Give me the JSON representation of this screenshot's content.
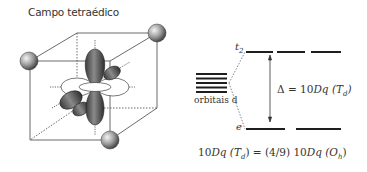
{
  "title": "Campo tetraédico",
  "left_figure": {
    "description": "Cube with ligands at alternating corners and d-orbital lobes at center",
    "ligand_count": 4
  },
  "energy_diagram": {
    "upper_level_label": "t",
    "upper_level_sub": "2",
    "lower_level_label": "e",
    "degenerate_label": "orbitais d",
    "splitting_label": "Δ = 10",
    "splitting_var": "Dq",
    "splitting_paren_open": " (T",
    "splitting_sub": "d",
    "splitting_paren_close": ")",
    "upper_level_count": 3,
    "lower_level_count": 2
  },
  "formula": {
    "part1": "10",
    "part1_var": "Dq",
    "part2": " (T",
    "part2_sub": "d",
    "part3": ") = (4/9) 10",
    "part3_var": "Dq",
    "part4": " (O",
    "part4_sub": "h",
    "part5": ")"
  },
  "colors": {
    "line": "#2a2a2a",
    "lobe_dark": "#4a4a4a",
    "text": "#333333"
  }
}
